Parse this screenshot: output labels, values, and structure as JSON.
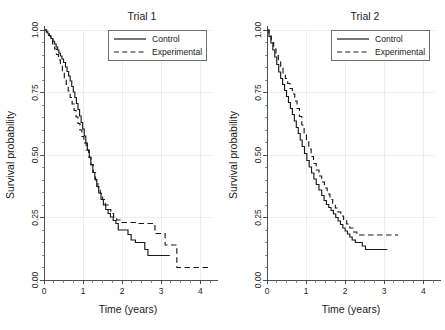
{
  "figure": {
    "background": "#ffffff",
    "line_color": "#1a1a1a",
    "grid_color": "#e8e8e8",
    "axis_color": "#3d3d3d",
    "width": 445,
    "height": 330
  },
  "chart_data": [
    {
      "type": "line",
      "title": "Trial 1",
      "subtitle": "",
      "xlabel": "Time (years)",
      "ylabel": "Survival probability",
      "xlim": [
        0,
        4.3
      ],
      "ylim": [
        0,
        1
      ],
      "xticks": [
        0,
        1,
        2,
        3,
        4
      ],
      "xticklabels": [
        "0",
        "1",
        "2",
        "3",
        "4"
      ],
      "yticks": [
        0.0,
        0.25,
        0.5,
        0.75,
        1.0
      ],
      "yticklabels": [
        "0.00",
        "0.25",
        "0.50",
        "0.75",
        "1.00"
      ],
      "xminor": [
        0.25,
        0.5,
        0.75,
        1.25,
        1.5,
        1.75,
        2.25,
        2.5,
        2.75,
        3.25,
        3.5,
        3.75,
        4.25
      ],
      "yminor": [
        0.05,
        0.1,
        0.15,
        0.2,
        0.3,
        0.35,
        0.4,
        0.45,
        0.55,
        0.6,
        0.65,
        0.7,
        0.8,
        0.85,
        0.9,
        0.95
      ],
      "grid": "vertical-faint",
      "legend_position": "top-right",
      "series": [
        {
          "name": "Control",
          "style": "solid",
          "x": [
            0.0,
            0.06,
            0.1,
            0.14,
            0.18,
            0.23,
            0.27,
            0.31,
            0.35,
            0.38,
            0.42,
            0.46,
            0.5,
            0.55,
            0.59,
            0.63,
            0.67,
            0.71,
            0.75,
            0.79,
            0.83,
            0.87,
            0.91,
            0.95,
            0.99,
            1.03,
            1.07,
            1.11,
            1.16,
            1.2,
            1.25,
            1.3,
            1.35,
            1.4,
            1.46,
            1.52,
            1.58,
            1.64,
            1.7,
            1.77,
            1.84,
            1.9,
            2.06,
            2.15,
            2.23,
            2.34,
            2.46,
            2.58,
            2.66,
            3.02,
            3.16,
            3.22
          ],
          "y": [
            1.0,
            0.993,
            0.985,
            0.976,
            0.966,
            0.955,
            0.944,
            0.932,
            0.92,
            0.908,
            0.896,
            0.884,
            0.87,
            0.852,
            0.834,
            0.816,
            0.796,
            0.774,
            0.752,
            0.73,
            0.706,
            0.682,
            0.656,
            0.63,
            0.604,
            0.576,
            0.548,
            0.52,
            0.49,
            0.46,
            0.43,
            0.402,
            0.374,
            0.348,
            0.322,
            0.3,
            0.282,
            0.266,
            0.252,
            0.238,
            0.226,
            0.2,
            0.2,
            0.182,
            0.16,
            0.15,
            0.15,
            0.122,
            0.098,
            0.098,
            0.098,
            0.098
          ]
        },
        {
          "name": "Experimental",
          "style": "dashed",
          "x": [
            0.0,
            0.07,
            0.12,
            0.17,
            0.22,
            0.27,
            0.32,
            0.37,
            0.42,
            0.47,
            0.52,
            0.57,
            0.62,
            0.67,
            0.72,
            0.77,
            0.82,
            0.87,
            0.92,
            0.97,
            1.02,
            1.08,
            1.14,
            1.2,
            1.26,
            1.32,
            1.38,
            1.44,
            1.5,
            1.57,
            1.64,
            1.71,
            1.78,
            1.86,
            1.95,
            2.1,
            2.36,
            2.5,
            2.62,
            2.84,
            2.98,
            3.1,
            3.3,
            3.4,
            4.22
          ],
          "y": [
            1.0,
            0.99,
            0.978,
            0.962,
            0.944,
            0.924,
            0.902,
            0.88,
            0.858,
            0.834,
            0.808,
            0.782,
            0.756,
            0.73,
            0.704,
            0.678,
            0.652,
            0.626,
            0.6,
            0.574,
            0.548,
            0.52,
            0.492,
            0.462,
            0.43,
            0.4,
            0.372,
            0.346,
            0.322,
            0.3,
            0.282,
            0.266,
            0.252,
            0.24,
            0.23,
            0.23,
            0.226,
            0.226,
            0.226,
            0.186,
            0.186,
            0.14,
            0.14,
            0.05,
            0.05
          ]
        }
      ]
    },
    {
      "type": "line",
      "title": "Trial 2",
      "subtitle": "",
      "xlabel": "Time (years)",
      "ylabel": "Survival probability",
      "xlim": [
        0,
        4.3
      ],
      "ylim": [
        0,
        1
      ],
      "xticks": [
        0,
        1,
        2,
        3,
        4
      ],
      "xticklabels": [
        "0",
        "1",
        "2",
        "3",
        "4"
      ],
      "yticks": [
        0.0,
        0.25,
        0.5,
        0.75,
        1.0
      ],
      "yticklabels": [
        "0.00",
        "0.25",
        "0.50",
        "0.75",
        "1.00"
      ],
      "xminor": [
        0.25,
        0.5,
        0.75,
        1.25,
        1.5,
        1.75,
        2.25,
        2.5,
        2.75,
        3.25,
        3.5,
        3.75,
        4.25
      ],
      "yminor": [
        0.05,
        0.1,
        0.15,
        0.2,
        0.3,
        0.35,
        0.4,
        0.45,
        0.55,
        0.6,
        0.65,
        0.7,
        0.8,
        0.85,
        0.9,
        0.95
      ],
      "grid": "vertical-faint",
      "legend_position": "top-right",
      "series": [
        {
          "name": "Control",
          "style": "solid",
          "x": [
            0.0,
            0.05,
            0.1,
            0.15,
            0.2,
            0.25,
            0.3,
            0.35,
            0.4,
            0.45,
            0.5,
            0.55,
            0.6,
            0.65,
            0.7,
            0.75,
            0.8,
            0.85,
            0.9,
            0.96,
            1.02,
            1.08,
            1.14,
            1.2,
            1.26,
            1.33,
            1.4,
            1.46,
            1.52,
            1.58,
            1.64,
            1.7,
            1.76,
            1.82,
            1.88,
            1.94,
            2.0,
            2.06,
            2.12,
            2.18,
            2.26,
            2.34,
            2.44,
            2.52,
            3.08
          ],
          "y": [
            1.0,
            0.974,
            0.948,
            0.92,
            0.892,
            0.862,
            0.832,
            0.806,
            0.782,
            0.758,
            0.734,
            0.71,
            0.686,
            0.662,
            0.636,
            0.61,
            0.586,
            0.56,
            0.534,
            0.506,
            0.478,
            0.452,
            0.428,
            0.404,
            0.382,
            0.36,
            0.338,
            0.318,
            0.302,
            0.29,
            0.278,
            0.264,
            0.25,
            0.236,
            0.222,
            0.208,
            0.196,
            0.184,
            0.172,
            0.16,
            0.15,
            0.15,
            0.136,
            0.122,
            0.122
          ]
        },
        {
          "name": "Experimental",
          "style": "dashed",
          "x": [
            0.0,
            0.05,
            0.11,
            0.17,
            0.23,
            0.29,
            0.35,
            0.41,
            0.47,
            0.53,
            0.59,
            0.65,
            0.71,
            0.77,
            0.83,
            0.89,
            0.95,
            1.01,
            1.07,
            1.13,
            1.19,
            1.26,
            1.33,
            1.4,
            1.47,
            1.54,
            1.61,
            1.68,
            1.75,
            1.82,
            1.89,
            1.96,
            2.04,
            2.12,
            2.2,
            2.3,
            3.36
          ],
          "y": [
            1.0,
            0.976,
            0.95,
            0.924,
            0.898,
            0.872,
            0.848,
            0.826,
            0.806,
            0.786,
            0.766,
            0.744,
            0.716,
            0.686,
            0.654,
            0.62,
            0.588,
            0.556,
            0.524,
            0.494,
            0.466,
            0.44,
            0.416,
            0.392,
            0.368,
            0.344,
            0.322,
            0.304,
            0.288,
            0.272,
            0.256,
            0.24,
            0.224,
            0.208,
            0.192,
            0.18,
            0.18
          ]
        }
      ]
    }
  ],
  "legend": {
    "entries": [
      {
        "label": "Control",
        "style": "solid"
      },
      {
        "label": "Experimental",
        "style": "dashed"
      }
    ]
  }
}
